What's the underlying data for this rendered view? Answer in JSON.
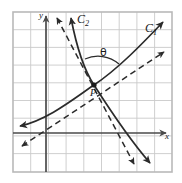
{
  "figure": {
    "type": "math-diagram",
    "width": 182,
    "height": 183,
    "colors": {
      "background": "#ffffff",
      "frame": "#b9b9b9",
      "grid": "#c9c9c9",
      "axis": "#4a4a4a",
      "curve": "#2b2b2b",
      "tangent": "#2b2b2b",
      "label": "#1a1a1a"
    },
    "frame": {
      "x": 13,
      "y": 12,
      "width": 159,
      "height": 160,
      "cols": 9,
      "rows": 9,
      "spacing": 17.7
    },
    "axes": {
      "x_label": "x",
      "y_label": "y",
      "x_axis_y": 133,
      "y_axis_x": 46,
      "x_arrow": "right",
      "y_arrow": "up"
    },
    "point": {
      "label": "P",
      "x": 94,
      "y": 85
    },
    "angle": {
      "label": "θ",
      "x": 103,
      "y": 52
    },
    "curves": [
      {
        "name": "C1",
        "label": "C",
        "sub": "1",
        "label_x": 146,
        "label_y": 24,
        "style": "solid",
        "shape": "increasing",
        "arrows": "both"
      },
      {
        "name": "C2",
        "label": "C",
        "sub": "2",
        "label_x": 78,
        "label_y": 15,
        "style": "solid",
        "shape": "decreasing",
        "arrows": "both"
      }
    ],
    "tangents": [
      {
        "name": "tangent-C1",
        "style": "dashed",
        "direction": "lower-left to upper-right",
        "arrows": "both"
      },
      {
        "name": "tangent-C2",
        "style": "dashed",
        "direction": "upper-left to lower-right",
        "arrows": "both"
      }
    ]
  }
}
